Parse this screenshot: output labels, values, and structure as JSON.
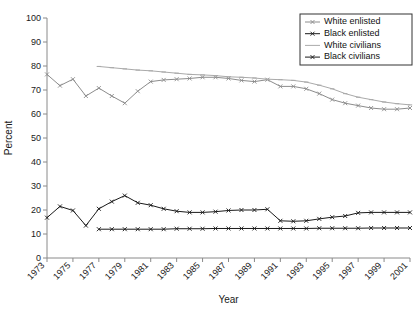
{
  "chart_data": {
    "type": "line",
    "title": "",
    "xlabel": "Year",
    "ylabel": "Percent",
    "xlim": [
      1973,
      2001
    ],
    "ylim": [
      0,
      100
    ],
    "grid": false,
    "legend_position": "top-right",
    "ytick_labels": [
      "0",
      "10",
      "20",
      "30",
      "40",
      "50",
      "60",
      "70",
      "80",
      "90",
      "100"
    ],
    "ytick_values": [
      0,
      10,
      20,
      30,
      40,
      50,
      60,
      70,
      80,
      90,
      100
    ],
    "xtick_labels": [
      "1973",
      "1975",
      "1977",
      "1979",
      "1981",
      "1983",
      "1985",
      "1987",
      "1989",
      "1991",
      "1993",
      "1995",
      "1997",
      "1999",
      "2001"
    ],
    "xtick_values": [
      1973,
      1975,
      1977,
      1979,
      1981,
      1983,
      1985,
      1987,
      1989,
      1991,
      1993,
      1995,
      1997,
      1999,
      2001
    ],
    "xtick_rotation": 45,
    "series": [
      {
        "name": "White enlisted",
        "color": "#8c8c8c",
        "marker": "cross",
        "x": [
          1973,
          1974,
          1975,
          1976,
          1977,
          1978,
          1979,
          1980,
          1981,
          1982,
          1983,
          1984,
          1985,
          1986,
          1987,
          1988,
          1989,
          1990,
          1991,
          1992,
          1993,
          1994,
          1995,
          1996,
          1997,
          1998,
          1999,
          2000,
          2001
        ],
        "values": [
          76.5,
          71.8,
          74.5,
          67.5,
          70.8,
          67.5,
          64.5,
          69.5,
          73.5,
          74.2,
          74.5,
          74.8,
          75.3,
          75.3,
          74.8,
          74.0,
          73.5,
          74.3,
          71.5,
          71.5,
          70.5,
          68.5,
          66.0,
          64.5,
          63.5,
          62.5,
          62.0,
          62.0,
          62.5
        ]
      },
      {
        "name": "Black enlisted",
        "color": "#1a1a1a",
        "marker": "cross",
        "x": [
          1973,
          1974,
          1975,
          1976,
          1977,
          1978,
          1979,
          1980,
          1981,
          1982,
          1983,
          1984,
          1985,
          1986,
          1987,
          1988,
          1989,
          1990,
          1991,
          1992,
          1993,
          1994,
          1995,
          1996,
          1997,
          1998,
          1999,
          2000,
          2001
        ],
        "values": [
          16.8,
          21.5,
          19.8,
          13.5,
          20.5,
          23.5,
          26.0,
          23.0,
          22.0,
          20.5,
          19.5,
          19.0,
          19.0,
          19.3,
          19.8,
          20.0,
          20.0,
          20.3,
          15.5,
          15.3,
          15.5,
          16.3,
          17.0,
          17.5,
          18.8,
          19.0,
          19.0,
          19.0,
          19.0
        ]
      },
      {
        "name": "White civilians",
        "color": "#aaaaaa",
        "marker": "dash",
        "x": [
          1977,
          1978,
          1979,
          1980,
          1981,
          1982,
          1983,
          1984,
          1985,
          1986,
          1987,
          1988,
          1989,
          1990,
          1991,
          1992,
          1993,
          1994,
          1995,
          1996,
          1997,
          1998,
          1999,
          2000,
          2001
        ],
        "values": [
          79.8,
          79.3,
          78.8,
          78.3,
          78.0,
          77.5,
          77.0,
          76.5,
          76.3,
          76.0,
          75.5,
          75.3,
          75.0,
          74.5,
          74.3,
          74.0,
          73.3,
          72.0,
          70.5,
          68.5,
          67.0,
          66.0,
          65.0,
          64.3,
          63.8
        ]
      },
      {
        "name": "Black civilians",
        "color": "#1a1a1a",
        "marker": "cross",
        "x": [
          1977,
          1978,
          1979,
          1980,
          1981,
          1982,
          1983,
          1984,
          1985,
          1986,
          1987,
          1988,
          1989,
          1990,
          1991,
          1992,
          1993,
          1994,
          1995,
          1996,
          1997,
          1998,
          1999,
          2000,
          2001
        ],
        "values": [
          12.0,
          12.0,
          12.0,
          12.0,
          12.0,
          12.0,
          12.2,
          12.2,
          12.2,
          12.3,
          12.3,
          12.3,
          12.3,
          12.3,
          12.3,
          12.3,
          12.3,
          12.4,
          12.4,
          12.4,
          12.4,
          12.5,
          12.5,
          12.5,
          12.5
        ]
      }
    ]
  },
  "legend": {
    "items": [
      {
        "label": "White enlisted"
      },
      {
        "label": "Black enlisted"
      },
      {
        "label": "White civilians"
      },
      {
        "label": "Black civilians"
      }
    ]
  }
}
